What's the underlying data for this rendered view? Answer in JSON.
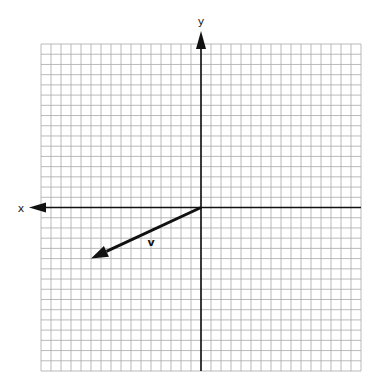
{
  "diagram": {
    "type": "coordinate-plane-vector",
    "grid": {
      "cells_x": 32,
      "cells_y": 32,
      "origin_cell": [
        16,
        16
      ],
      "color": "#a8a8a8"
    },
    "axes": {
      "x_label": "x",
      "y_label": "y",
      "x_arrow_direction": "left",
      "y_arrow_direction": "up",
      "color": "#111111"
    },
    "vectors": [
      {
        "label": "v",
        "from": [
          0,
          0
        ],
        "to": [
          -11,
          -5
        ],
        "color": "#111111"
      }
    ]
  }
}
